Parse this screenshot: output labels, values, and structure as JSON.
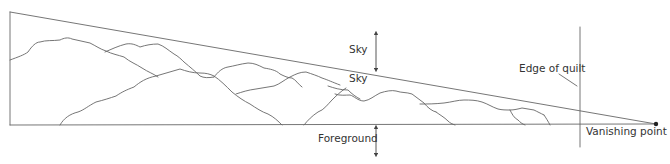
{
  "diagram": {
    "colors": {
      "line": "#555555",
      "text": "#333333",
      "background": "#ffffff"
    },
    "labels": {
      "sky_upper": "Sky",
      "sky_lower": "Sky",
      "edge_of_quilt": "Edge of quilt",
      "foreground": "Foreground",
      "vanishing_point": "Vanishing point"
    },
    "icons": {
      "sky_arrow": "double-headed-vertical-arrow",
      "foreground_arrow": "double-headed-vertical-arrow",
      "vanishing_point_marker": "filled-dot"
    }
  }
}
